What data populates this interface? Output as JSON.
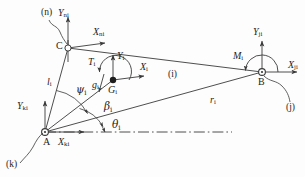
{
  "figure": {
    "type": "kinematic-free-body-diagram"
  },
  "points": [
    {
      "name": "A",
      "label": "A",
      "x": 45,
      "y": 132,
      "marker": "open-circle-pivot"
    },
    {
      "name": "B",
      "label": "B",
      "x": 262,
      "y": 72,
      "marker": "open-circle-pivot"
    },
    {
      "name": "C",
      "label": "C",
      "x": 68,
      "y": 48,
      "marker": "open-circle-pivot"
    },
    {
      "name": "Gi",
      "label": "G",
      "sub": "i",
      "x": 113,
      "y": 80,
      "marker": "filled-circle"
    }
  ],
  "labels": {
    "frame_n": "(n)",
    "frame_k": "(k)",
    "frame_j": "(j)",
    "body_i": "(i)",
    "point_A": "A",
    "point_B": "B",
    "point_C": "C",
    "Yni": {
      "base": "Y",
      "sub": "ni"
    },
    "Xni": {
      "base": "X",
      "sub": "ni"
    },
    "Yki": {
      "base": "Y",
      "sub": "ki"
    },
    "Xki": {
      "base": "X",
      "sub": "ki"
    },
    "Yji": {
      "base": "Y",
      "sub": "ji"
    },
    "Xji": {
      "base": "X",
      "sub": "ji"
    },
    "Yi": {
      "base": "Y",
      "sub": "i"
    },
    "Xi": {
      "base": "X",
      "sub": "i"
    },
    "Gi": {
      "base": "G",
      "sub": "i"
    },
    "gi": {
      "base": "g",
      "sub": "i"
    },
    "Ti": {
      "base": "T",
      "sub": "i"
    },
    "Mi": {
      "base": "M",
      "sub": "i"
    },
    "li": {
      "base": "l",
      "sub": "i"
    },
    "ri": {
      "base": "r",
      "sub": "i"
    },
    "psi_i": {
      "base": "ψ",
      "sub": "i"
    },
    "beta_i": {
      "base": "β",
      "sub": "i"
    },
    "theta_i": {
      "base": "θ",
      "sub": "i"
    }
  },
  "angles": [
    {
      "name": "psi_i",
      "symbol": "ψ",
      "sub": "i",
      "vertex": "A",
      "between": [
        "AC",
        "AGi"
      ]
    },
    {
      "name": "beta_i",
      "symbol": "β",
      "sub": "i",
      "vertex": "A",
      "between": [
        "AGi",
        "AB"
      ]
    },
    {
      "name": "theta_i",
      "symbol": "θ",
      "sub": "i",
      "vertex": "A",
      "between": [
        "AB",
        "horizontal-datum"
      ]
    }
  ],
  "segments": [
    {
      "name": "link-A-C",
      "from": "A",
      "to": "C",
      "label": "li"
    },
    {
      "name": "link-A-B",
      "from": "A",
      "to": "B",
      "label": "ri"
    },
    {
      "name": "link-C-B",
      "from": "C",
      "to": "B",
      "label": null
    },
    {
      "name": "link-A-Gi",
      "from": "A",
      "to": "Gi",
      "label": null
    },
    {
      "name": "datum-line",
      "from": "A",
      "to": "right",
      "style": "dash-dot"
    }
  ],
  "colors": {
    "stroke": "#3a3a3a",
    "text": "#1d1d1d",
    "background": "#fdfdfd"
  }
}
